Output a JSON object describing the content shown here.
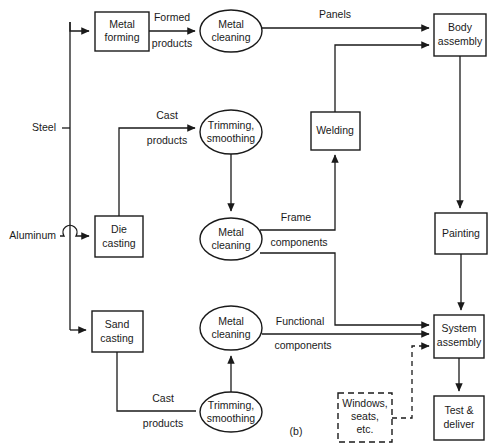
{
  "figure": {
    "caption": "(b)",
    "width": 492,
    "height": 447,
    "background_color": "#ffffff",
    "line_color": "#1a1a1a"
  },
  "inputs": [
    {
      "id": "steel",
      "label": "Steel"
    },
    {
      "id": "aluminum",
      "label": "Aluminum"
    }
  ],
  "nodes": {
    "metal_forming": {
      "label_line1": "Metal",
      "label_line2": "forming",
      "shape": "rect"
    },
    "metal_cleaning_top": {
      "label_line1": "Metal",
      "label_line2": "cleaning",
      "shape": "ellipse"
    },
    "body_assembly": {
      "label_line1": "Body",
      "label_line2": "assembly",
      "shape": "rect"
    },
    "trimming_top": {
      "label_line1": "Trimming,",
      "label_line2": "smoothing",
      "shape": "ellipse"
    },
    "welding": {
      "label_line1": "Welding",
      "label_line2": "",
      "shape": "rect"
    },
    "die_casting": {
      "label_line1": "Die",
      "label_line2": "casting",
      "shape": "rect"
    },
    "metal_cleaning_mid": {
      "label_line1": "Metal",
      "label_line2": "cleaning",
      "shape": "ellipse"
    },
    "painting": {
      "label_line1": "Painting",
      "label_line2": "",
      "shape": "rect"
    },
    "sand_casting": {
      "label_line1": "Sand",
      "label_line2": "casting",
      "shape": "rect"
    },
    "metal_cleaning_bot": {
      "label_line1": "Metal",
      "label_line2": "cleaning",
      "shape": "ellipse"
    },
    "system_assembly": {
      "label_line1": "System",
      "label_line2": "assembly",
      "shape": "rect"
    },
    "trimming_bot": {
      "label_line1": "Trimming,",
      "label_line2": "smoothing",
      "shape": "ellipse"
    },
    "windows_seats": {
      "label_line1": "Windows,",
      "label_line2": "seats,",
      "label_line3": "etc.",
      "shape": "rect-dashed"
    },
    "test_deliver": {
      "label_line1": "Test &",
      "label_line2": "deliver",
      "shape": "rect"
    }
  },
  "edge_labels": {
    "formed_products_1": "Formed",
    "formed_products_2": "products",
    "panels": "Panels",
    "cast_products_top_1": "Cast",
    "cast_products_top_2": "products",
    "frame_components_1": "Frame",
    "frame_components_2": "components",
    "functional_components_1": "Functional",
    "functional_components_2": "components",
    "cast_products_bot_1": "Cast",
    "cast_products_bot_2": "products"
  }
}
